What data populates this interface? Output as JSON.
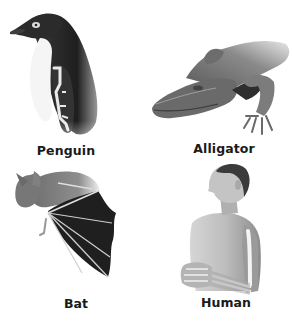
{
  "figure": {
    "panels": [
      {
        "id": "penguin",
        "label": "Penguin",
        "subject": "penguin-illustration"
      },
      {
        "id": "alligator",
        "label": "Alligator",
        "subject": "alligator-illustration"
      },
      {
        "id": "bat",
        "label": "Bat",
        "subject": "bat-illustration"
      },
      {
        "id": "human",
        "label": "Human",
        "subject": "human-illustration"
      }
    ],
    "colors": {
      "background": "#ffffff",
      "label_text": "#1a1a1a",
      "dark_fill": "#2a2a2a",
      "mid_fill": "#7a7a7a",
      "light_fill": "#d8d8d8",
      "bone": "#f2f2f2"
    }
  }
}
